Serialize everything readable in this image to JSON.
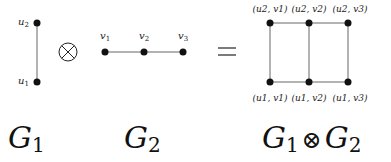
{
  "g1": {
    "title": "G",
    "sub": "1",
    "nodes": [
      {
        "id": "u2",
        "label": "u",
        "sub": "2"
      },
      {
        "id": "u1",
        "label": "u",
        "sub": "1"
      }
    ]
  },
  "operator": "⊗",
  "g2": {
    "title": "G",
    "sub": "2",
    "nodes": [
      {
        "id": "v1",
        "label": "v",
        "sub": "1"
      },
      {
        "id": "v2",
        "label": "v",
        "sub": "2"
      },
      {
        "id": "v3",
        "label": "v",
        "sub": "3"
      }
    ]
  },
  "equals": "=",
  "product": {
    "title_left": "G",
    "title_left_sub": "1",
    "title_op": "⊗",
    "title_right": "G",
    "title_right_sub": "2",
    "top_labels": [
      "(u2, v1)",
      "(u2, v2)",
      "(u2, v3)"
    ],
    "bottom_labels": [
      "(u1, v1)",
      "(u1, v2)",
      "(u1, v3)"
    ]
  }
}
